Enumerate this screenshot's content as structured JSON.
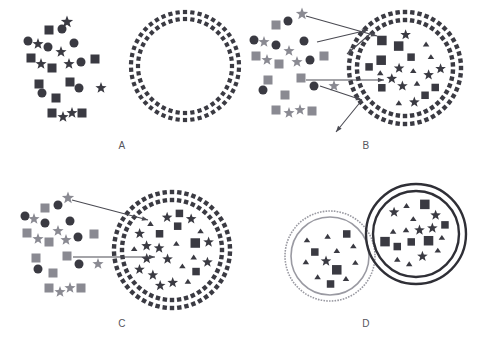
{
  "figure": {
    "width": 488,
    "height": 360,
    "background": "#ffffff"
  },
  "colors": {
    "dark": "#3a3a42",
    "gray": "#8a8a92",
    "arrow": "#4a4a52",
    "label": "#55555c",
    "ring_dark": "#2f2f36",
    "ring_gray": "#9a9aa2",
    "white": "#ffffff"
  },
  "panels": [
    {
      "id": "A",
      "label": "A",
      "description": "Free dark particles at left; empty double-dotted vesicle at right",
      "arrow_count": 0,
      "vesicle": {
        "cx": 185,
        "cy": 66,
        "r_outer": 54,
        "r_inner": 47,
        "style": "double-dotted",
        "ring_color": "#3a3a42",
        "filled": false,
        "content_count": 0
      },
      "cluster": {
        "color_mix": "all-dark",
        "shapes": [
          {
            "t": "star",
            "x": 67,
            "y": 22,
            "s": 11,
            "c": "dark"
          },
          {
            "t": "square",
            "x": 49,
            "y": 30,
            "s": 9,
            "c": "dark"
          },
          {
            "t": "circle",
            "x": 62,
            "y": 29,
            "s": 9,
            "c": "dark"
          },
          {
            "t": "circle",
            "x": 28,
            "y": 41,
            "s": 9,
            "c": "dark"
          },
          {
            "t": "star",
            "x": 38,
            "y": 44,
            "s": 10,
            "c": "dark"
          },
          {
            "t": "circle",
            "x": 48,
            "y": 47,
            "s": 9,
            "c": "dark"
          },
          {
            "t": "circle",
            "x": 74,
            "y": 43,
            "s": 9,
            "c": "dark"
          },
          {
            "t": "star",
            "x": 61,
            "y": 52,
            "s": 10,
            "c": "dark"
          },
          {
            "t": "square",
            "x": 31,
            "y": 58,
            "s": 9,
            "c": "dark"
          },
          {
            "t": "star",
            "x": 41,
            "y": 64,
            "s": 10,
            "c": "dark"
          },
          {
            "t": "square",
            "x": 52,
            "y": 68,
            "s": 9,
            "c": "dark"
          },
          {
            "t": "star",
            "x": 69,
            "y": 64,
            "s": 10,
            "c": "dark"
          },
          {
            "t": "circle",
            "x": 81,
            "y": 62,
            "s": 9,
            "c": "dark"
          },
          {
            "t": "square",
            "x": 95,
            "y": 59,
            "s": 9,
            "c": "dark"
          },
          {
            "t": "square",
            "x": 39,
            "y": 84,
            "s": 9,
            "c": "dark"
          },
          {
            "t": "square",
            "x": 70,
            "y": 82,
            "s": 9,
            "c": "dark"
          },
          {
            "t": "circle",
            "x": 42,
            "y": 93,
            "s": 9,
            "c": "dark"
          },
          {
            "t": "circle",
            "x": 79,
            "y": 88,
            "s": 9,
            "c": "dark"
          },
          {
            "t": "star",
            "x": 101,
            "y": 88,
            "s": 10,
            "c": "dark"
          },
          {
            "t": "square",
            "x": 56,
            "y": 98,
            "s": 9,
            "c": "dark"
          },
          {
            "t": "square",
            "x": 52,
            "y": 113,
            "s": 9,
            "c": "dark"
          },
          {
            "t": "star",
            "x": 63,
            "y": 117,
            "s": 10,
            "c": "dark"
          },
          {
            "t": "star",
            "x": 72,
            "y": 113,
            "s": 10,
            "c": "dark"
          },
          {
            "t": "square",
            "x": 82,
            "y": 113,
            "s": 9,
            "c": "dark"
          }
        ]
      }
    },
    {
      "id": "B",
      "label": "B",
      "description": "Mixed dark and gray particles at left; two arrows enter and two arrows exit a loaded double-dotted vesicle",
      "arrow_count": 4,
      "vesicle": {
        "cx": 161,
        "cy": 68,
        "r_outer": 56,
        "r_inner": 48,
        "style": "double-dotted",
        "ring_color": "#3a3a42",
        "filled": true,
        "content_count": 33
      },
      "cluster": {
        "color_mix": "dark-and-gray",
        "shapes": [
          {
            "t": "star",
            "x": 58,
            "y": 14,
            "s": 11,
            "c": "gray"
          },
          {
            "t": "circle",
            "x": 44,
            "y": 21,
            "s": 9,
            "c": "dark"
          },
          {
            "t": "square",
            "x": 32,
            "y": 25,
            "s": 9,
            "c": "gray"
          },
          {
            "t": "circle",
            "x": 10,
            "y": 40,
            "s": 9,
            "c": "dark"
          },
          {
            "t": "star",
            "x": 20,
            "y": 42,
            "s": 10,
            "c": "gray"
          },
          {
            "t": "circle",
            "x": 32,
            "y": 45,
            "s": 9,
            "c": "dark"
          },
          {
            "t": "circle",
            "x": 60,
            "y": 41,
            "s": 9,
            "c": "dark"
          },
          {
            "t": "star",
            "x": 45,
            "y": 51,
            "s": 10,
            "c": "gray"
          },
          {
            "t": "square",
            "x": 12,
            "y": 56,
            "s": 9,
            "c": "gray"
          },
          {
            "t": "star",
            "x": 23,
            "y": 60,
            "s": 10,
            "c": "gray"
          },
          {
            "t": "square",
            "x": 35,
            "y": 64,
            "s": 9,
            "c": "gray"
          },
          {
            "t": "star",
            "x": 53,
            "y": 62,
            "s": 10,
            "c": "gray"
          },
          {
            "t": "circle",
            "x": 66,
            "y": 60,
            "s": 9,
            "c": "dark"
          },
          {
            "t": "square",
            "x": 80,
            "y": 56,
            "s": 9,
            "c": "gray"
          },
          {
            "t": "square",
            "x": 24,
            "y": 80,
            "s": 9,
            "c": "gray"
          },
          {
            "t": "square",
            "x": 57,
            "y": 78,
            "s": 9,
            "c": "gray"
          },
          {
            "t": "circle",
            "x": 19,
            "y": 90,
            "s": 9,
            "c": "dark"
          },
          {
            "t": "circle",
            "x": 70,
            "y": 86,
            "s": 9,
            "c": "dark"
          },
          {
            "t": "star",
            "x": 90,
            "y": 86,
            "s": 10,
            "c": "gray"
          },
          {
            "t": "square",
            "x": 41,
            "y": 95,
            "s": 9,
            "c": "gray"
          },
          {
            "t": "square",
            "x": 32,
            "y": 110,
            "s": 9,
            "c": "gray"
          },
          {
            "t": "star",
            "x": 45,
            "y": 113,
            "s": 10,
            "c": "gray"
          },
          {
            "t": "star",
            "x": 56,
            "y": 110,
            "s": 10,
            "c": "gray"
          },
          {
            "t": "square",
            "x": 68,
            "y": 111,
            "s": 9,
            "c": "gray"
          }
        ]
      },
      "arrows": [
        {
          "x1": 62,
          "y1": 16,
          "x2": 133,
          "y2": 36,
          "dir": "in"
        },
        {
          "x1": 73,
          "y1": 42,
          "x2": 124,
          "y2": 30,
          "dir": "in"
        },
        {
          "x1": 126,
          "y1": 34,
          "x2": 103,
          "y2": 54,
          "dir": "out"
        },
        {
          "x1": 62,
          "y1": 80,
          "x2": 140,
          "y2": 80,
          "dir": "in"
        },
        {
          "x1": 76,
          "y1": 86,
          "x2": 118,
          "y2": 100,
          "dir": "mid"
        },
        {
          "x1": 118,
          "y1": 100,
          "x2": 92,
          "y2": 132,
          "dir": "out"
        }
      ]
    },
    {
      "id": "C",
      "label": "C",
      "description": "Mixed particles at left; two arrows enter a densely loaded double-dotted vesicle",
      "arrow_count": 2,
      "vesicle": {
        "cx": 172,
        "cy": 72,
        "r_outer": 58,
        "r_inner": 50,
        "style": "double-dotted",
        "ring_color": "#3a3a42",
        "filled": true,
        "content_count": 36
      },
      "cluster": {
        "color_mix": "dark-and-gray",
        "shapes": [
          {
            "t": "star",
            "x": 68,
            "y": 20,
            "s": 11,
            "c": "gray"
          },
          {
            "t": "circle",
            "x": 58,
            "y": 27,
            "s": 9,
            "c": "dark"
          },
          {
            "t": "square",
            "x": 45,
            "y": 30,
            "s": 9,
            "c": "gray"
          },
          {
            "t": "circle",
            "x": 25,
            "y": 38,
            "s": 9,
            "c": "dark"
          },
          {
            "t": "star",
            "x": 34,
            "y": 41,
            "s": 10,
            "c": "gray"
          },
          {
            "t": "circle",
            "x": 45,
            "y": 45,
            "s": 9,
            "c": "dark"
          },
          {
            "t": "circle",
            "x": 70,
            "y": 43,
            "s": 9,
            "c": "dark"
          },
          {
            "t": "star",
            "x": 58,
            "y": 53,
            "s": 10,
            "c": "gray"
          },
          {
            "t": "square",
            "x": 27,
            "y": 55,
            "s": 9,
            "c": "gray"
          },
          {
            "t": "star",
            "x": 38,
            "y": 61,
            "s": 10,
            "c": "gray"
          },
          {
            "t": "square",
            "x": 49,
            "y": 64,
            "s": 9,
            "c": "gray"
          },
          {
            "t": "star",
            "x": 66,
            "y": 62,
            "s": 10,
            "c": "gray"
          },
          {
            "t": "circle",
            "x": 78,
            "y": 59,
            "s": 9,
            "c": "dark"
          },
          {
            "t": "square",
            "x": 94,
            "y": 56,
            "s": 9,
            "c": "gray"
          },
          {
            "t": "square",
            "x": 36,
            "y": 80,
            "s": 9,
            "c": "gray"
          },
          {
            "t": "square",
            "x": 67,
            "y": 78,
            "s": 9,
            "c": "gray"
          },
          {
            "t": "circle",
            "x": 38,
            "y": 91,
            "s": 9,
            "c": "dark"
          },
          {
            "t": "circle",
            "x": 79,
            "y": 86,
            "s": 9,
            "c": "dark"
          },
          {
            "t": "star",
            "x": 98,
            "y": 86,
            "s": 10,
            "c": "gray"
          },
          {
            "t": "square",
            "x": 53,
            "y": 95,
            "s": 9,
            "c": "gray"
          },
          {
            "t": "square",
            "x": 49,
            "y": 110,
            "s": 9,
            "c": "gray"
          },
          {
            "t": "star",
            "x": 60,
            "y": 114,
            "s": 10,
            "c": "gray"
          },
          {
            "t": "star",
            "x": 70,
            "y": 110,
            "s": 10,
            "c": "gray"
          },
          {
            "t": "square",
            "x": 81,
            "y": 110,
            "s": 9,
            "c": "gray"
          }
        ]
      },
      "arrows": [
        {
          "x1": 72,
          "y1": 22,
          "x2": 148,
          "y2": 42,
          "dir": "in"
        },
        {
          "x1": 73,
          "y1": 79,
          "x2": 155,
          "y2": 79,
          "dir": "in"
        }
      ]
    },
    {
      "id": "D",
      "label": "D",
      "description": "Two sealed vesicles with solid rings, both densely loaded; left has gray rings, right has black rings",
      "arrow_count": 0,
      "vesicles": [
        {
          "name": "gray-vesicle",
          "cx": 86,
          "cy": 78,
          "r_outer": 45,
          "r_inner": 39,
          "style": "solid-double",
          "ring_color": "#9a9aa2",
          "filled": true,
          "content_count": 30
        },
        {
          "name": "black-vesicle",
          "cx": 172,
          "cy": 56,
          "r_outer": 50,
          "r_inner": 43,
          "style": "solid-double",
          "ring_color": "#2f2f36",
          "filled": true,
          "content_count": 33
        }
      ]
    }
  ],
  "cargo_shapes": {
    "types": [
      "square",
      "star",
      "triangle"
    ],
    "color": "#3a3a42",
    "note": "vesicle interiors contain squares, stars and triangles only"
  }
}
